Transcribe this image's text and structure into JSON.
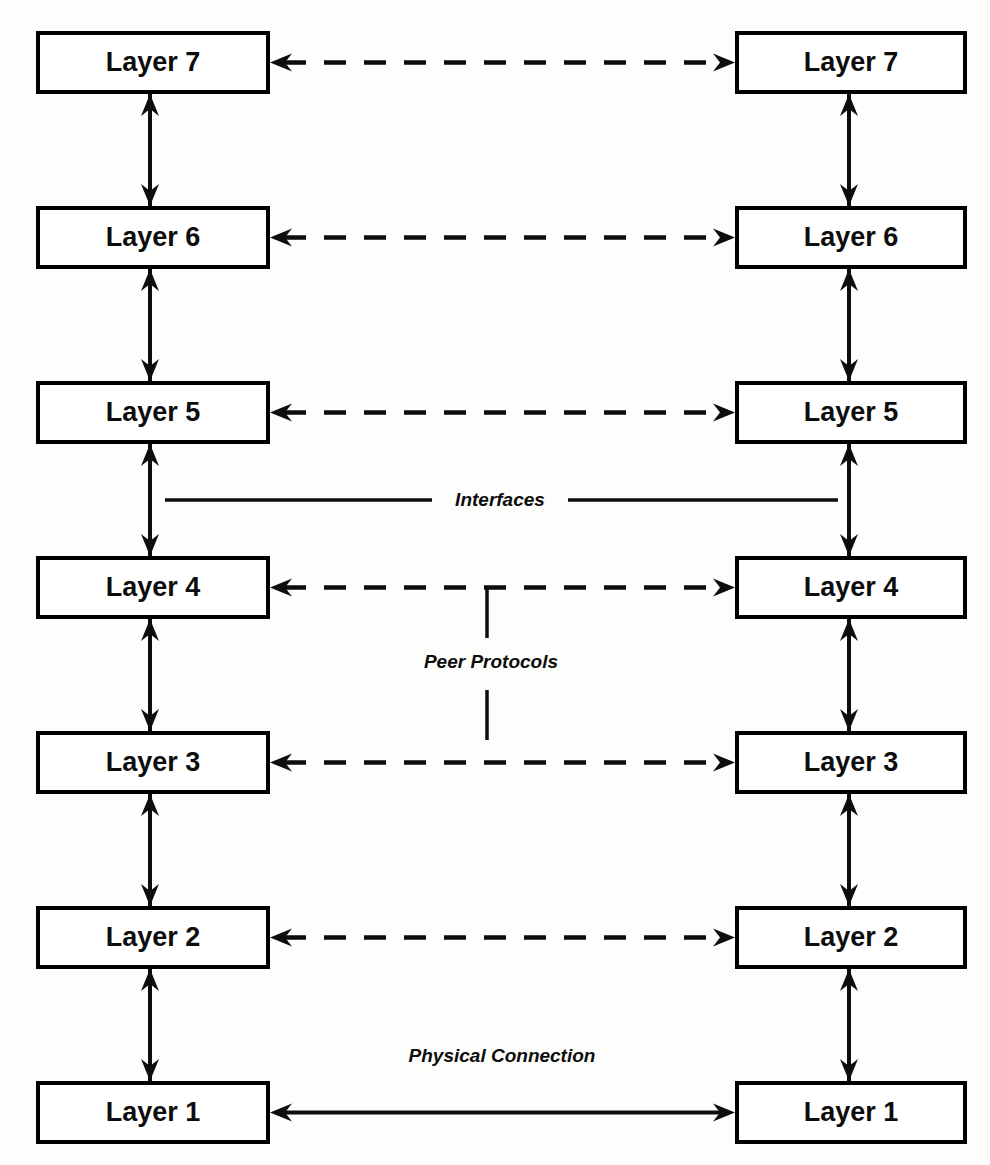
{
  "diagram": {
    "type": "layered-stack",
    "stroke_color": "#0d0d0d",
    "background_color": "#fdfdfc",
    "columns": [
      {
        "id": "left",
        "name": "left-stack",
        "x": 38,
        "width": 230
      },
      {
        "id": "right",
        "name": "right-stack",
        "x": 737,
        "width": 228
      }
    ],
    "row_pitch": 175,
    "box_height": 59,
    "rows": [
      {
        "index": 0,
        "y": 33,
        "left_label": "Layer 7",
        "right_label": "Layer 7",
        "link": "dashed"
      },
      {
        "index": 1,
        "y": 208,
        "left_label": "Layer 6",
        "right_label": "Layer 6",
        "link": "dashed"
      },
      {
        "index": 2,
        "y": 383,
        "left_label": "Layer 5",
        "right_label": "Layer 5",
        "link": "dashed"
      },
      {
        "index": 3,
        "y": 558,
        "left_label": "Layer 4",
        "right_label": "Layer 4",
        "link": "dashed"
      },
      {
        "index": 4,
        "y": 733,
        "left_label": "Layer 3",
        "right_label": "Layer 3",
        "link": "dashed"
      },
      {
        "index": 5,
        "y": 908,
        "left_label": "Layer 2",
        "right_label": "Layer 2",
        "link": "dashed"
      },
      {
        "index": 6,
        "y": 1083,
        "left_label": "Layer 1",
        "right_label": "Layer 1",
        "link": "solid"
      }
    ],
    "annotations": {
      "interfaces": {
        "label": "Interfaces",
        "style": "italic-bold",
        "x": 500,
        "y": 500,
        "rule_left_start": 165,
        "rule_left_end": 432,
        "rule_right_start": 568,
        "rule_right_end": 838
      },
      "peer_protocols": {
        "label": "Peer Protocols",
        "style": "italic-bold",
        "x": 491,
        "y": 663,
        "line_x": 487,
        "line_top_start": 586,
        "line_top_end": 638,
        "line_bottom_start": 690,
        "line_bottom_end": 740
      },
      "physical_connection": {
        "label": "Physical Connection",
        "style": "italic-bold",
        "x": 502,
        "y": 1057,
        "arrow_y": 1112
      }
    },
    "vertical_interface_arrows": {
      "description": "double-headed arrows joining adjacent layers within each stack",
      "left_x": 150,
      "right_x": 849,
      "count_per_stack": 6
    },
    "horizontal_peer_arrows": {
      "description": "double-headed horizontal links between matching layers in the two stacks",
      "start_x": 268,
      "end_x": 737
    }
  }
}
